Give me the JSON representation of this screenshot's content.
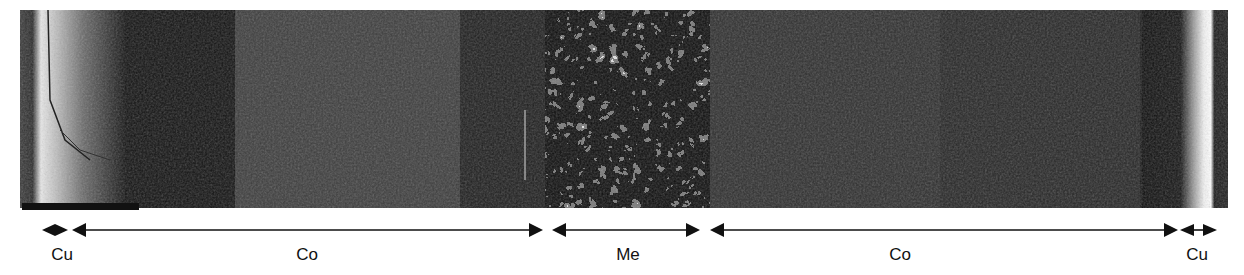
{
  "figure": {
    "type": "SEM cross-section micrograph",
    "scale_bar": {
      "label": ""
    },
    "regions": [
      {
        "id": "cu-left",
        "label": "Cu",
        "x_start": 42,
        "x_end": 68,
        "label_x": 62
      },
      {
        "id": "co-left",
        "label": "Co",
        "x_start": 72,
        "x_end": 543,
        "label_x": 307
      },
      {
        "id": "me",
        "label": "Me",
        "x_start": 555,
        "x_end": 700,
        "label_x": 628
      },
      {
        "id": "co-right",
        "label": "Co",
        "x_start": 710,
        "x_end": 1178,
        "label_x": 900
      },
      {
        "id": "cu-right",
        "label": "Cu",
        "x_start": 1180,
        "x_end": 1217,
        "label_x": 1197
      }
    ],
    "colors": {
      "background": "#ffffff",
      "ink": "#111111",
      "micrograph_dark": "#1a1a1a"
    }
  }
}
